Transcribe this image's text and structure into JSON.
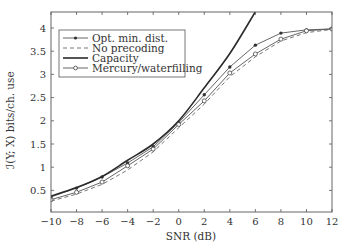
{
  "chart_data": {
    "type": "line",
    "title": "",
    "xlabel": "SNR (dB)",
    "ylabel": "ℐ(Y; X) bits/ch. use",
    "xlim": [
      -10,
      12
    ],
    "ylim": [
      0.07,
      4.35
    ],
    "xticks": [
      -10,
      -8,
      -6,
      -4,
      -2,
      0,
      2,
      4,
      6,
      8,
      10,
      12
    ],
    "xtick_labels": [
      "−10",
      "−8",
      "−6",
      "−4",
      "−2",
      "0",
      "2",
      "4",
      "6",
      "8",
      "10",
      "12"
    ],
    "yticks": [
      0.5,
      1,
      1.5,
      2,
      2.5,
      3,
      3.5,
      4
    ],
    "ytick_labels": [
      "0.5",
      "1",
      "1.5",
      "2",
      "2.5",
      "3",
      "3.5",
      "4"
    ],
    "grid": false,
    "legend_position": "upper left",
    "x": [
      -10,
      -8,
      -6,
      -4,
      -2,
      0,
      2,
      4,
      6,
      8,
      10,
      12
    ],
    "series": [
      {
        "name": "Opt. min. dist.",
        "style": "solid",
        "marker": "dot",
        "color": "#555555",
        "values": [
          0.36,
          0.55,
          0.79,
          1.09,
          1.44,
          1.96,
          2.56,
          3.16,
          3.63,
          3.89,
          3.96,
          3.98
        ]
      },
      {
        "name": "No precoding",
        "style": "dashed",
        "marker": "none",
        "color": "#666666",
        "values": [
          0.27,
          0.42,
          0.63,
          0.94,
          1.33,
          1.85,
          2.36,
          2.95,
          3.38,
          3.72,
          3.9,
          3.97
        ]
      },
      {
        "name": "Capacity",
        "style": "solid-thick",
        "marker": "none",
        "color": "#2a2a2a",
        "values": [
          0.38,
          0.56,
          0.8,
          1.15,
          1.5,
          2.0,
          2.71,
          3.45,
          4.35,
          null,
          null,
          null
        ]
      },
      {
        "name": "Mercury/waterfilling",
        "style": "solid",
        "marker": "circle",
        "color": "#555555",
        "values": [
          0.3,
          0.46,
          0.68,
          1.03,
          1.39,
          1.92,
          2.43,
          3.03,
          3.44,
          3.76,
          3.94,
          3.98
        ]
      }
    ]
  },
  "legend": {
    "items": [
      {
        "label": "Opt. min. dist."
      },
      {
        "label": "No precoding"
      },
      {
        "label": "Capacity"
      },
      {
        "label": "Mercury/waterfilling"
      }
    ]
  },
  "axes": {
    "xlabel": "SNR (dB)",
    "ylabel": "ℐ(Y; X) bits/ch. use"
  }
}
